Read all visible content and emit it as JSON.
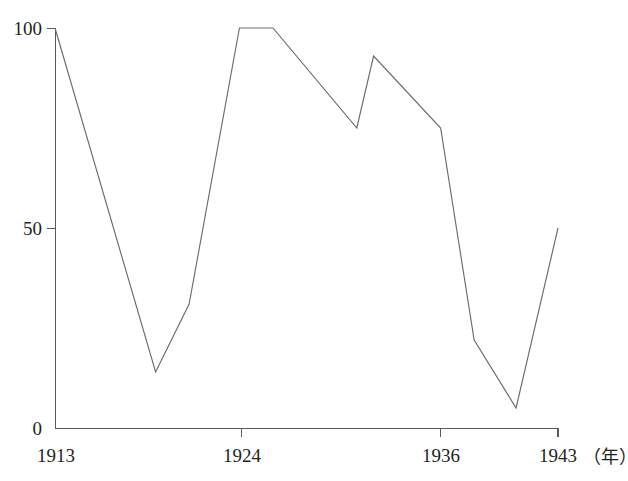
{
  "chart_data": {
    "type": "line",
    "title": "",
    "subtitle": "",
    "xlabel": "",
    "ylabel": "",
    "x_unit_note": "（年）",
    "xlim": [
      1913,
      1943
    ],
    "ylim": [
      0,
      100
    ],
    "grid": false,
    "legend": false,
    "legend_position": "none",
    "x_ticks": [
      {
        "value": 1913,
        "label": "1913"
      },
      {
        "value": 1924,
        "label": "1924"
      },
      {
        "value": 1936,
        "label": "1936"
      },
      {
        "value": 1943,
        "label": "1943"
      }
    ],
    "y_ticks": [
      {
        "value": 0,
        "label": "0"
      },
      {
        "value": 50,
        "label": "50"
      },
      {
        "value": 100,
        "label": "100"
      }
    ],
    "series": [
      {
        "name": "index",
        "color": "#6b6b6b",
        "x": [
          1913,
          1919,
          1921,
          1924,
          1926,
          1931,
          1932,
          1936,
          1938,
          1940.5,
          1943
        ],
        "values": [
          100,
          14,
          31,
          100,
          100,
          75,
          93,
          75,
          22,
          5,
          50
        ]
      }
    ]
  },
  "axis_geometry": {
    "plot_left_px": 55,
    "plot_right_px": 558,
    "plot_top_px": 28,
    "plot_bottom_px": 428
  }
}
